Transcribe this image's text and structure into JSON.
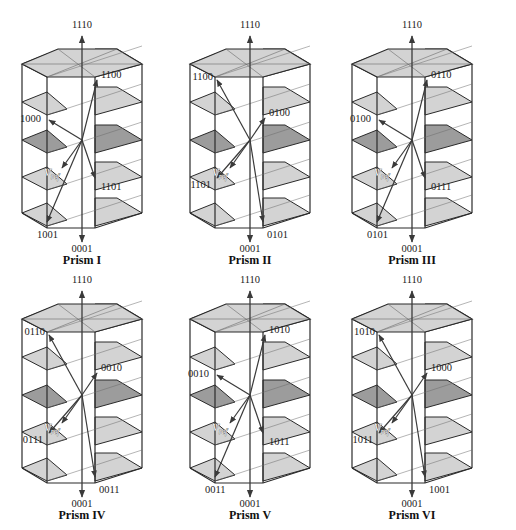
{
  "figure": {
    "colors": {
      "edge": "#2a2a2a",
      "thin": "#6a6a6a",
      "shelf_light": "#d3d3d3",
      "shelf_dark": "#9c9c9c",
      "arrow": "#3a3a3a"
    },
    "prisms": [
      {
        "title": "Prism I",
        "top_label": "1110",
        "bottom_label": "0001",
        "vertex_labels": [
          {
            "text": "1100",
            "pos": "upper-right"
          },
          {
            "text": "1000",
            "pos": "mid-left"
          },
          {
            "text": "1101",
            "pos": "lower-right"
          },
          {
            "text": "1001",
            "pos": "bottom-left"
          }
        ],
        "vref_label": "V",
        "vref_sub": "ref"
      },
      {
        "title": "Prism II",
        "top_label": "1110",
        "bottom_label": "0001",
        "vertex_labels": [
          {
            "text": "1100",
            "pos": "upper-left"
          },
          {
            "text": "0100",
            "pos": "mid-right"
          },
          {
            "text": "1101",
            "pos": "lower-left"
          },
          {
            "text": "0101",
            "pos": "bottom-right"
          }
        ],
        "vref_label": "V",
        "vref_sub": "ref"
      },
      {
        "title": "Prism III",
        "top_label": "1110",
        "bottom_label": "0001",
        "vertex_labels": [
          {
            "text": "0110",
            "pos": "upper-right"
          },
          {
            "text": "0100",
            "pos": "mid-left"
          },
          {
            "text": "0111",
            "pos": "lower-right"
          },
          {
            "text": "0101",
            "pos": "bottom-left"
          }
        ],
        "vref_label": "V",
        "vref_sub": "ref"
      },
      {
        "title": "Prism IV",
        "top_label": "1110",
        "bottom_label": "0001",
        "vertex_labels": [
          {
            "text": "0110",
            "pos": "upper-left"
          },
          {
            "text": "0010",
            "pos": "mid-right"
          },
          {
            "text": "0111",
            "pos": "lower-left"
          },
          {
            "text": "0011",
            "pos": "bottom-right"
          }
        ],
        "vref_label": "V",
        "vref_sub": "ref"
      },
      {
        "title": "Prism V",
        "top_label": "1110",
        "bottom_label": "0001",
        "vertex_labels": [
          {
            "text": "1010",
            "pos": "upper-right"
          },
          {
            "text": "0010",
            "pos": "mid-left"
          },
          {
            "text": "1011",
            "pos": "lower-right"
          },
          {
            "text": "0011",
            "pos": "bottom-left"
          }
        ],
        "vref_label": "V",
        "vref_sub": "ref"
      },
      {
        "title": "Prism VI",
        "top_label": "1110",
        "bottom_label": "0001",
        "vertex_labels": [
          {
            "text": "1010",
            "pos": "upper-left"
          },
          {
            "text": "1000",
            "pos": "mid-right"
          },
          {
            "text": "1011",
            "pos": "lower-left"
          },
          {
            "text": "1001",
            "pos": "bottom-right"
          }
        ],
        "vref_label": "V",
        "vref_sub": "ref"
      }
    ]
  }
}
